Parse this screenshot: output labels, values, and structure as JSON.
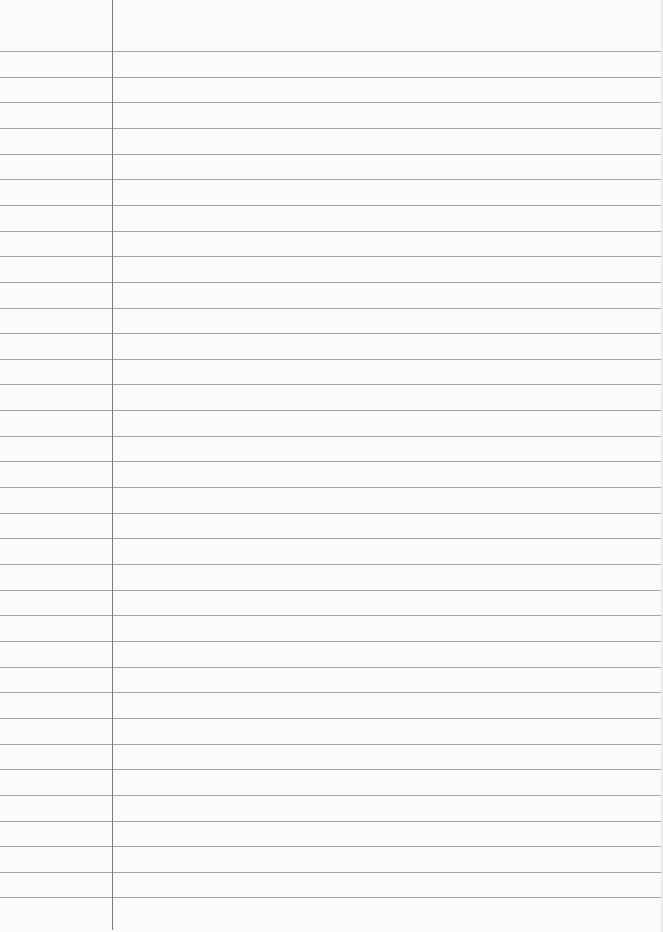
{
  "document": {
    "type": "lined-paper",
    "background_color": "#fbfbfa",
    "rule_color": "#a3a3a3",
    "margin_line_color": "#7d7d7d",
    "margin_line_x": 112,
    "margin_line_height": 930,
    "first_rule_y": 51,
    "rule_spacing": 25.65,
    "rule_count": 34,
    "text": ""
  }
}
